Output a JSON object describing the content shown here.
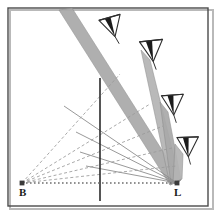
{
  "figure": {
    "kind": "geometric-optics-diagram",
    "width": 219,
    "height": 217,
    "background_color": "#ffffff"
  },
  "frame": {
    "border_color": "#4a4a4a",
    "border_width": 1.4,
    "inset": 8,
    "shadow_color": "#b9b9b9"
  },
  "colors": {
    "beam_fill": "#a9a9a9",
    "beam_fill_alt": "#b4b4b4",
    "beam_edge": "#8d8d8d",
    "dashed_ray": "#9a9a9a",
    "baseline": "#6e6e6e",
    "vertical_line": "#2b2b2b",
    "camera_stroke": "#2d2d2d",
    "camera_fill": "#ffffff",
    "camera_dark": "#1c1c1c",
    "label_color": "#1a1a1a",
    "node_color": "#3a3a3a"
  },
  "vertices": [
    {
      "id": "B",
      "label": "B",
      "x": 22,
      "y": 183,
      "label_x": 19,
      "label_y": 196
    },
    {
      "id": "L",
      "label": "L",
      "x": 177,
      "y": 183,
      "label_x": 174,
      "label_y": 196
    }
  ],
  "baseline": {
    "name": "baseline-B-to-L",
    "from": "B",
    "to": "L",
    "x1": 22,
    "y1": 183,
    "x2": 177,
    "y2": 183,
    "style": "dotted",
    "dash_pattern": "1.6 2.4",
    "width": 1.3
  },
  "vertical_line": {
    "name": "image-plane-line",
    "x": 100,
    "y_top": 78,
    "y_bottom": 201,
    "width": 1.6,
    "style": "solid"
  },
  "cameras": [
    {
      "id": "cam1",
      "label": "camera-station-1",
      "x": 112,
      "y": 26,
      "rotation": -16,
      "scale": 1.0
    },
    {
      "id": "cam2",
      "label": "camera-station-2",
      "x": 152,
      "y": 50,
      "rotation": -6,
      "scale": 1.05
    },
    {
      "id": "cam3",
      "label": "camera-station-3",
      "x": 173,
      "y": 104,
      "rotation": -4,
      "scale": 1.0
    },
    {
      "id": "cam4",
      "label": "camera-station-4",
      "x": 188,
      "y": 146,
      "rotation": -2,
      "scale": 0.98
    }
  ],
  "beams": [
    {
      "id": "beam1",
      "label": "beam-from-upper-left",
      "note": "wide band descending from top-left toward L",
      "points": "59,10 72,8 181,180 170,185",
      "fill_key": "beam_fill"
    },
    {
      "id": "beam2",
      "label": "beam-camera-2-to-L",
      "points": "141,50 150,60 180,181 170,185",
      "fill_key": "beam_fill_alt"
    },
    {
      "id": "beam3",
      "label": "beam-camera-3-to-L",
      "points": "160,102 168,112 181,180 171,184",
      "fill_key": "beam_fill"
    },
    {
      "id": "beam4",
      "label": "beam-camera-4-to-L",
      "points": "175,144 183,154 182,179 173,183",
      "fill_key": "beam_fill_alt"
    }
  ],
  "dashed_rays": [
    {
      "id": "ray1",
      "label": "dashed-ray-1",
      "x1": 22,
      "y1": 183,
      "x2": 120,
      "y2": 74
    },
    {
      "id": "ray2",
      "label": "dashed-ray-2",
      "x1": 22,
      "y1": 183,
      "x2": 150,
      "y2": 104
    },
    {
      "id": "ray3",
      "label": "dashed-ray-3",
      "x1": 22,
      "y1": 183,
      "x2": 163,
      "y2": 126
    },
    {
      "id": "ray4",
      "label": "dashed-ray-4",
      "x1": 22,
      "y1": 183,
      "x2": 172,
      "y2": 148
    },
    {
      "id": "ray5",
      "label": "dashed-ray-5",
      "x1": 22,
      "y1": 183,
      "x2": 176,
      "y2": 166
    }
  ],
  "solid_rays": [
    {
      "id": "sray1",
      "label": "solid-ray-1",
      "x1": 177,
      "y1": 183,
      "x2": 64,
      "y2": 106
    },
    {
      "id": "sray2",
      "label": "solid-ray-2",
      "x1": 177,
      "y1": 183,
      "x2": 76,
      "y2": 132
    },
    {
      "id": "sray3",
      "label": "solid-ray-3",
      "x1": 177,
      "y1": 183,
      "x2": 80,
      "y2": 152
    },
    {
      "id": "sray4",
      "label": "solid-ray-4",
      "x1": 177,
      "y1": 183,
      "x2": 86,
      "y2": 166
    }
  ]
}
